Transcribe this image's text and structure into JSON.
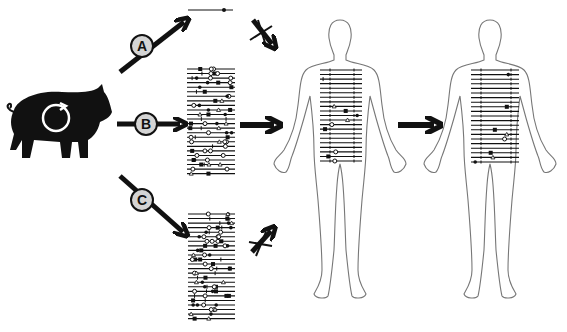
{
  "diagram": {
    "source": {
      "name": "pig",
      "icon": "pig-with-cycle-icon"
    },
    "pathways": [
      {
        "label": "A",
        "description": "single variant line",
        "outcome": "blocked",
        "lines": 1
      },
      {
        "label": "B",
        "description": "full variant panel",
        "outcome": "transfer",
        "lines": 24
      },
      {
        "label": "C",
        "description": "variant panel",
        "outcome": "blocked",
        "lines": 24
      }
    ],
    "targets": [
      {
        "name": "human-recipient-1"
      },
      {
        "name": "human-recipient-2"
      }
    ],
    "colors": {
      "ink": "#111111",
      "label_fill": "#d4d4d4",
      "outline": "#777777",
      "background": "#ffffff"
    }
  }
}
